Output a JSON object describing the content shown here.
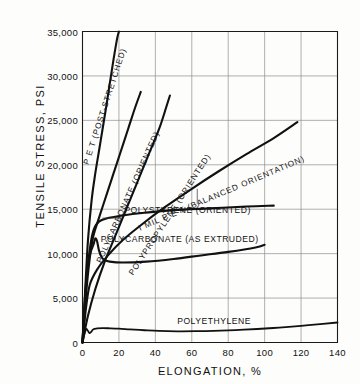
{
  "chart_data": {
    "type": "line",
    "title": "",
    "xlabel": "ELONGATION, %",
    "ylabel": "TENSILE STRESS, PSI",
    "xlim": [
      0,
      140
    ],
    "ylim": [
      0,
      35000
    ],
    "xticks": [
      "0",
      "20",
      "40",
      "60",
      "80",
      "100",
      "120",
      "140"
    ],
    "xtick_values": [
      0,
      20,
      40,
      60,
      80,
      100,
      120,
      140
    ],
    "yticks": [
      "0",
      "5,000",
      "10,000",
      "15,000",
      "20,000",
      "25,000",
      "30,000",
      "35,000"
    ],
    "ytick_values": [
      0,
      5000,
      10000,
      15000,
      20000,
      25000,
      30000,
      35000
    ],
    "grid": true,
    "legend_position": "inline-curve-labels",
    "series": [
      {
        "name": "P E T  (POST-STRETCHED)",
        "label": "P E T  (POST-STRETCHED)",
        "label_angle_deg": -72,
        "points": [
          [
            0,
            0
          ],
          [
            1.5,
            6000
          ],
          [
            3,
            11500
          ],
          [
            5,
            16000
          ],
          [
            7,
            19000
          ],
          [
            9,
            21500
          ],
          [
            11,
            24000
          ],
          [
            13,
            26500
          ],
          [
            15,
            29200
          ],
          [
            17,
            31800
          ],
          [
            19,
            34200
          ],
          [
            20,
            35000
          ]
        ]
      },
      {
        "name": "POLYCARBONATE (ORIENTED)",
        "label": "POLYCARBONATE (ORIENTED)",
        "label_angle_deg": -66,
        "points": [
          [
            0,
            0
          ],
          [
            2,
            5500
          ],
          [
            4,
            9500
          ],
          [
            6,
            12000
          ],
          [
            9,
            14000
          ],
          [
            13,
            16500
          ],
          [
            17,
            19000
          ],
          [
            21,
            21500
          ],
          [
            25,
            24000
          ],
          [
            29,
            26500
          ],
          [
            32,
            28200
          ]
        ]
      },
      {
        "name": "POLYPROPYLENE (ORIENTED)",
        "label": "POLYPROPYLENE (ORIENTED)",
        "label_angle_deg": -57,
        "points": [
          [
            0,
            0
          ],
          [
            3,
            3000
          ],
          [
            7,
            6000
          ],
          [
            12,
            9000
          ],
          [
            18,
            12000
          ],
          [
            24,
            15000
          ],
          [
            30,
            18000
          ],
          [
            36,
            21000
          ],
          [
            42,
            24000
          ],
          [
            46,
            26500
          ],
          [
            48,
            27800
          ]
        ]
      },
      {
        "name": "I MIL P E T (BALANCED ORIENTATION)",
        "label": "I MIL  P E T  (BALANCED ORIENTATION)",
        "label_angle_deg": -23,
        "points": [
          [
            0,
            0
          ],
          [
            2,
            4000
          ],
          [
            4,
            6500
          ],
          [
            8,
            8200
          ],
          [
            14,
            9800
          ],
          [
            22,
            11500
          ],
          [
            32,
            13200
          ],
          [
            45,
            15200
          ],
          [
            60,
            17300
          ],
          [
            75,
            19300
          ],
          [
            90,
            21200
          ],
          [
            105,
            23000
          ],
          [
            118,
            24800
          ]
        ]
      },
      {
        "name": "POLYSTYRENE (ORIENTED)",
        "label": "POLYSTYRENE (ORIENTED)",
        "points": [
          [
            0,
            0
          ],
          [
            2,
            6500
          ],
          [
            4,
            10500
          ],
          [
            6,
            12600
          ],
          [
            9,
            13600
          ],
          [
            14,
            14000
          ],
          [
            22,
            14300
          ],
          [
            34,
            14600
          ],
          [
            50,
            14900
          ],
          [
            70,
            15100
          ],
          [
            90,
            15300
          ],
          [
            105,
            15400
          ]
        ]
      },
      {
        "name": "POLYCARBONATE (AS EXTRUDED)",
        "label": "POLYCARBONATE (AS EXTRUDED)",
        "points": [
          [
            0,
            0
          ],
          [
            1.5,
            5500
          ],
          [
            3,
            8800
          ],
          [
            4.5,
            10200
          ],
          [
            6,
            11000
          ],
          [
            7,
            11700
          ],
          [
            8,
            11400
          ],
          [
            9,
            10400
          ],
          [
            10.5,
            9600
          ],
          [
            12,
            9300
          ],
          [
            15,
            9100
          ],
          [
            22,
            9000
          ],
          [
            35,
            9100
          ],
          [
            50,
            9400
          ],
          [
            65,
            9800
          ],
          [
            80,
            10200
          ],
          [
            95,
            10700
          ],
          [
            100,
            11000
          ]
        ]
      },
      {
        "name": "POLYETHYLENE",
        "label": "POLYETHYLENE",
        "points": [
          [
            0,
            0
          ],
          [
            1,
            900
          ],
          [
            2,
            1500
          ],
          [
            3,
            1300
          ],
          [
            4,
            1050
          ],
          [
            5,
            1250
          ],
          [
            6,
            1500
          ],
          [
            8,
            1580
          ],
          [
            11,
            1620
          ],
          [
            15,
            1600
          ],
          [
            20,
            1560
          ],
          [
            26,
            1480
          ],
          [
            34,
            1380
          ],
          [
            42,
            1300
          ],
          [
            52,
            1260
          ],
          [
            62,
            1270
          ],
          [
            72,
            1310
          ],
          [
            84,
            1400
          ],
          [
            96,
            1520
          ],
          [
            108,
            1680
          ],
          [
            120,
            1880
          ],
          [
            132,
            2100
          ],
          [
            140,
            2250
          ]
        ]
      }
    ]
  }
}
